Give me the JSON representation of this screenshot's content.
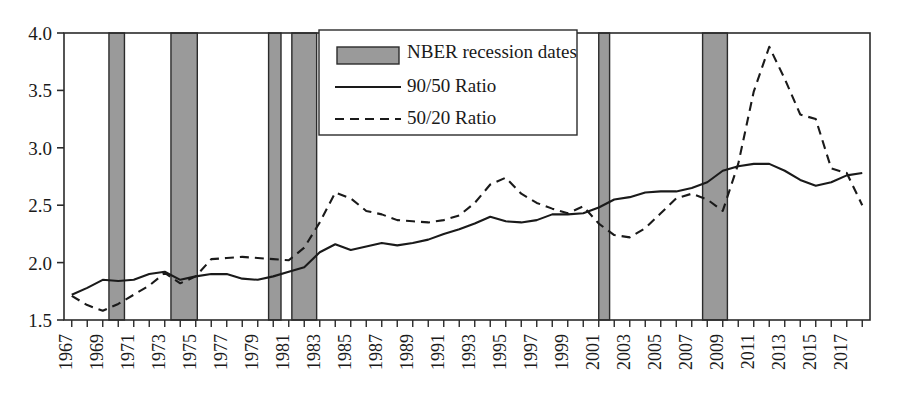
{
  "chart_data": {
    "type": "line",
    "title": "",
    "subtitle": "",
    "xlabel": "",
    "ylabel": "",
    "xlim": [
      1966.5,
      2018.5
    ],
    "ylim": [
      1.5,
      4.0
    ],
    "yticks": [
      1.5,
      2.0,
      2.5,
      3.0,
      3.5,
      4.0
    ],
    "ytick_labels": [
      "1.5",
      "2.0",
      "2.5",
      "3.0",
      "3.5",
      "4.0"
    ],
    "xtick_labels": [
      "1967",
      "1969",
      "1971",
      "1973",
      "1975",
      "1977",
      "1979",
      "1981",
      "1983",
      "1985",
      "1987",
      "1989",
      "1991",
      "1993",
      "1995",
      "1997",
      "1999",
      "2001",
      "2003",
      "2005",
      "2007",
      "2009",
      "2011",
      "2013",
      "2015",
      "2017"
    ],
    "xtick_values": [
      1967,
      1969,
      1971,
      1973,
      1975,
      1977,
      1979,
      1981,
      1983,
      1985,
      1987,
      1989,
      1991,
      1993,
      1995,
      1997,
      1999,
      2001,
      2003,
      2005,
      2007,
      2009,
      2011,
      2013,
      2015,
      2017
    ],
    "xtick_rotation": 90,
    "minor_xticks_every": 1,
    "grid": false,
    "legend_position": "top-center-right",
    "x": [
      1967,
      1968,
      1969,
      1970,
      1971,
      1972,
      1973,
      1974,
      1975,
      1976,
      1977,
      1978,
      1979,
      1980,
      1981,
      1982,
      1983,
      1984,
      1985,
      1986,
      1987,
      1988,
      1989,
      1990,
      1991,
      1992,
      1993,
      1994,
      1995,
      1996,
      1997,
      1998,
      1999,
      2000,
      2001,
      2002,
      2003,
      2004,
      2005,
      2006,
      2007,
      2008,
      2009,
      2010,
      2011,
      2012,
      2013,
      2014,
      2015,
      2016,
      2017,
      2018
    ],
    "series": [
      {
        "name": "90/50 Ratio",
        "style": "solid",
        "color": "#1a1a1a",
        "values": [
          1.72,
          1.78,
          1.85,
          1.84,
          1.85,
          1.9,
          1.92,
          1.85,
          1.88,
          1.9,
          1.9,
          1.86,
          1.85,
          1.88,
          1.92,
          1.96,
          2.09,
          2.16,
          2.11,
          2.14,
          2.17,
          2.15,
          2.17,
          2.2,
          2.25,
          2.29,
          2.34,
          2.4,
          2.36,
          2.35,
          2.37,
          2.42,
          2.42,
          2.43,
          2.48,
          2.55,
          2.57,
          2.61,
          2.62,
          2.62,
          2.65,
          2.7,
          2.8,
          2.84,
          2.86,
          2.86,
          2.8,
          2.72,
          2.67,
          2.7,
          2.76,
          2.78
        ],
        "marker": "none"
      },
      {
        "name": "50/20 Ratio",
        "style": "dashed",
        "color": "#1a1a1a",
        "values": [
          1.71,
          1.63,
          1.58,
          1.64,
          1.72,
          1.8,
          1.91,
          1.82,
          1.88,
          2.03,
          2.04,
          2.05,
          2.04,
          2.03,
          2.02,
          2.13,
          2.35,
          2.61,
          2.56,
          2.45,
          2.42,
          2.37,
          2.36,
          2.35,
          2.37,
          2.41,
          2.52,
          2.68,
          2.74,
          2.6,
          2.52,
          2.47,
          2.43,
          2.49,
          2.34,
          2.24,
          2.22,
          2.3,
          2.43,
          2.56,
          2.6,
          2.55,
          2.45,
          2.86,
          3.49,
          3.88,
          3.6,
          3.29,
          3.25,
          2.82,
          2.78,
          2.5
        ],
        "marker": "none"
      }
    ],
    "shaded_regions": {
      "label": "NBER recession dates",
      "fill_color": "#9a9a9a",
      "edge_color": "#2b2b2b",
      "spans": [
        {
          "start": 1969.4,
          "end": 1970.4
        },
        {
          "start": 1973.4,
          "end": 1975.1
        },
        {
          "start": 1979.7,
          "end": 1980.5
        },
        {
          "start": 1981.2,
          "end": 1982.8
        },
        {
          "start": 2001.0,
          "end": 2001.7
        },
        {
          "start": 2007.7,
          "end": 2009.3
        }
      ]
    },
    "annotations": []
  },
  "legend": {
    "items": [
      {
        "label": "NBER recession dates",
        "kind": "swatch"
      },
      {
        "label": "90/50 Ratio",
        "kind": "solid-line"
      },
      {
        "label": "50/20 Ratio",
        "kind": "dashed-line"
      }
    ]
  },
  "colors": {
    "axis": "#2b2b2b",
    "text": "#1a1a1a",
    "band_fill": "#9a9a9a",
    "band_edge": "#2b2b2b",
    "line": "#1a1a1a",
    "background": "#ffffff"
  }
}
